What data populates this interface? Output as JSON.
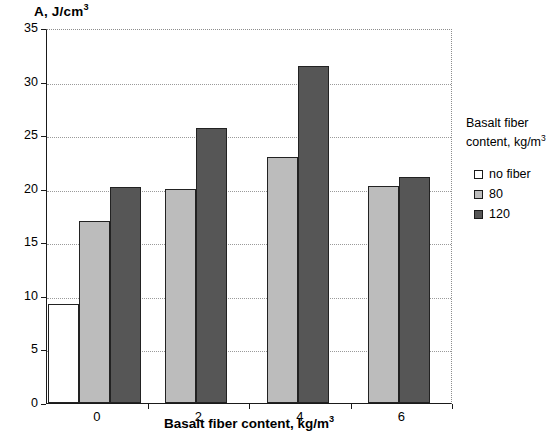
{
  "chart_data": {
    "type": "bar",
    "xlabel": "Basalt fiber content, kg/m³",
    "ylabel": "A, J/cm³",
    "categories": [
      "0",
      "2",
      "4",
      "6"
    ],
    "series": [
      {
        "name": "no fiber",
        "color": "#ffffff",
        "values": [
          9.2,
          null,
          null,
          null
        ]
      },
      {
        "name": "80",
        "color": "#bcbcbc",
        "values": [
          17.0,
          20.0,
          23.0,
          20.3
        ]
      },
      {
        "name": "120",
        "color": "#565656",
        "values": [
          20.2,
          25.7,
          31.5,
          21.1
        ]
      }
    ],
    "ylim": [
      0,
      35
    ],
    "yticks": [
      0,
      5,
      10,
      15,
      20,
      25,
      30,
      35
    ],
    "ytick_labels": [
      "0",
      "5",
      "10",
      "15",
      "20",
      "25",
      "30",
      "35"
    ],
    "grid": true,
    "grid_style": "dotted-horizontal",
    "legend_position": "right",
    "legend_title": "Basalt fiber content, kg/m³"
  },
  "axis": {
    "y_title": "A, J/cm",
    "y_title_sup": "3",
    "x_title": "Basalt fiber content, kg/m",
    "x_title_sup": "3"
  },
  "legend": {
    "title_line1": "Basalt fiber",
    "title_line2": "content, kg/m",
    "title_sup": "3",
    "items": [
      {
        "label": "no fiber"
      },
      {
        "label": "80"
      },
      {
        "label": "120"
      }
    ]
  }
}
